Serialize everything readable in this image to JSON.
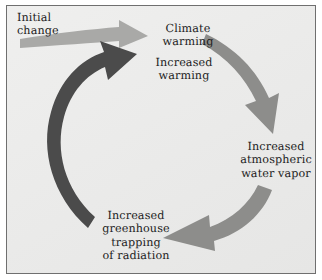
{
  "figure": {
    "background_color": "#ebebea",
    "border_color": "#6f6f6f",
    "text_color": "#1b1b1b"
  },
  "nodes": [
    {
      "id": "initial-change",
      "label": "Initial\nchange",
      "x": 17,
      "y": 11
    },
    {
      "id": "climate-warming",
      "label": "Climate\nwarming",
      "x": 151,
      "y": 22
    },
    {
      "id": "increased-warming",
      "label": "Increased\nwarming",
      "x": 143,
      "y": 56
    },
    {
      "id": "atmospheric-water-vapor",
      "label": "Increased\natmospheric\nwater vapor",
      "x": 236,
      "y": 140
    },
    {
      "id": "greenhouse-trapping",
      "label": "Increased\ngreenhouse\ntrapping\nof radiation",
      "x": 88,
      "y": 209
    }
  ],
  "arrows": [
    {
      "id": "initial-change-arrow",
      "from": "initial-change",
      "to": "climate-warming",
      "color": "#a9a9a7",
      "direction": "right",
      "shape": "straight-tapered"
    },
    {
      "id": "warming-to-water-vapor-arrow",
      "from": "climate-warming",
      "to": "atmospheric-water-vapor",
      "color": "#8d8d8b",
      "direction": "clockwise-down-right",
      "shape": "curved"
    },
    {
      "id": "water-vapor-to-greenhouse-arrow",
      "from": "atmospheric-water-vapor",
      "to": "greenhouse-trapping",
      "color": "#8d8d8b",
      "direction": "clockwise-down-left",
      "shape": "curved"
    },
    {
      "id": "greenhouse-to-warming-arrow",
      "from": "greenhouse-trapping",
      "to": "increased-warming",
      "color": "#4b4b4b",
      "direction": "counterclockwise-up-right",
      "shape": "curved-thick"
    }
  ]
}
